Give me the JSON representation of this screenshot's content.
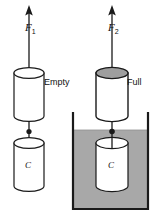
{
  "figure": {
    "colors": {
      "stroke": "#1a1a1a",
      "liquid_fill": "#a8a8a8",
      "cylinder_top_shaded": "#9e9e9e",
      "cylinder_body": "#ffffff",
      "background": "#ffffff"
    },
    "left_panel": {
      "force_label": "F",
      "force_subscript": "1",
      "upper_cylinder_label": "Empty",
      "lower_cylinder_label": "C",
      "arrow_direction": "up",
      "medium": "air"
    },
    "right_panel": {
      "force_label": "F",
      "force_subscript": "2",
      "upper_cylinder_label": "Full",
      "lower_cylinder_label": "C",
      "arrow_direction": "up",
      "medium": "liquid"
    }
  }
}
